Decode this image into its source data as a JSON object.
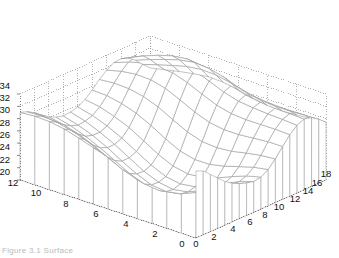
{
  "figure": {
    "kind": "3d-mesh-surface-plot",
    "background_color": "#ffffff",
    "mesh_line_color": "#9a9a9a",
    "mesh_face_color": "#ffffff",
    "grid_line_color": "#8c8c8c",
    "axis_line_color": "#6f6f6f",
    "tick_text_color": "#111111",
    "caption_text": "Figure  3.1  Surface",
    "caption_color": "#c2c2c2"
  },
  "chart_data": {
    "type": "surface",
    "title": "",
    "xlabel": "",
    "ylabel": "",
    "zlabel": "",
    "projection": "3d-mesh-with-skirt",
    "grid": true,
    "legend": null,
    "x_axis": {
      "name": "x-axis-right",
      "ticks": [
        0,
        2,
        4,
        6,
        8,
        10,
        12,
        14,
        16,
        18
      ],
      "tick_labels": [
        "0",
        "2",
        "4",
        "6",
        "8",
        "10",
        "12",
        "14",
        "16",
        "18"
      ],
      "range": [
        0,
        18
      ]
    },
    "y_axis": {
      "name": "y-axis-left",
      "ticks": [
        0,
        2,
        4,
        6,
        8,
        10,
        12
      ],
      "tick_labels": [
        "0",
        "2",
        "4",
        "6",
        "8",
        "10",
        "12"
      ],
      "range": [
        0,
        12
      ]
    },
    "z_axis": {
      "name": "z-axis-vertical",
      "ticks": [
        20,
        22,
        24,
        26,
        28,
        30,
        32,
        34
      ],
      "tick_labels": [
        "20",
        "22",
        "24",
        "26",
        "28",
        "30",
        "32",
        "34"
      ],
      "range": [
        20,
        34
      ]
    },
    "nx": 19,
    "ny": 13,
    "z_values": [
      [
        30.9,
        30.4,
        29.3,
        28.2,
        27.1,
        26.3,
        25.7,
        25.3,
        25.0,
        25.2,
        25.9,
        27.1,
        28.6,
        30.0,
        31.0,
        31.5,
        31.2,
        30.4,
        29.4
      ],
      [
        30.4,
        29.8,
        28.6,
        27.3,
        26.1,
        25.2,
        24.6,
        24.3,
        24.2,
        24.6,
        25.5,
        26.9,
        28.6,
        30.1,
        31.2,
        31.6,
        31.2,
        30.3,
        29.2
      ],
      [
        29.6,
        28.9,
        27.6,
        26.2,
        24.9,
        23.9,
        23.3,
        23.0,
        23.1,
        23.7,
        24.8,
        26.5,
        28.4,
        30.1,
        31.3,
        31.7,
        31.2,
        30.2,
        29.0
      ],
      [
        28.8,
        28.0,
        26.6,
        25.1,
        23.7,
        22.6,
        21.9,
        21.7,
        21.9,
        22.7,
        24.1,
        26.0,
        28.2,
        30.1,
        31.5,
        31.9,
        31.3,
        30.2,
        28.9
      ],
      [
        28.3,
        27.4,
        25.9,
        24.3,
        22.8,
        21.6,
        20.9,
        20.7,
        21.0,
        22.0,
        23.6,
        25.8,
        28.2,
        30.3,
        31.8,
        32.3,
        31.6,
        30.4,
        29.0
      ],
      [
        28.2,
        27.3,
        25.7,
        24.0,
        22.4,
        21.2,
        20.5,
        20.3,
        20.7,
        21.8,
        23.6,
        26.0,
        28.6,
        30.9,
        32.5,
        33.0,
        32.2,
        30.9,
        29.4
      ],
      [
        28.5,
        27.6,
        26.0,
        24.3,
        22.7,
        21.5,
        20.8,
        20.7,
        21.1,
        22.3,
        24.2,
        26.8,
        29.5,
        31.9,
        33.5,
        34.0,
        33.1,
        31.6,
        30.0
      ],
      [
        29.2,
        28.3,
        26.8,
        25.1,
        23.6,
        22.4,
        21.8,
        21.7,
        22.2,
        23.4,
        25.4,
        28.0,
        30.7,
        33.0,
        34.4,
        34.7,
        33.7,
        32.1,
        30.4
      ],
      [
        30.0,
        29.2,
        27.8,
        26.2,
        24.8,
        23.7,
        23.1,
        23.1,
        23.6,
        24.8,
        26.8,
        29.3,
        31.8,
        33.8,
        34.9,
        35.0,
        33.9,
        32.2,
        30.5
      ],
      [
        30.7,
        30.0,
        28.7,
        27.3,
        26.0,
        25.0,
        24.5,
        24.5,
        25.0,
        26.2,
        28.0,
        30.2,
        32.4,
        34.0,
        34.8,
        34.7,
        33.5,
        31.9,
        30.2
      ],
      [
        31.1,
        30.5,
        29.4,
        28.1,
        27.0,
        26.1,
        25.7,
        25.7,
        26.2,
        27.2,
        28.8,
        30.7,
        32.5,
        33.8,
        34.3,
        34.0,
        32.8,
        31.3,
        29.8
      ],
      [
        31.2,
        30.7,
        29.8,
        28.7,
        27.7,
        27.0,
        26.6,
        26.7,
        27.1,
        28.0,
        29.3,
        30.8,
        32.2,
        33.2,
        33.5,
        33.1,
        32.0,
        30.6,
        29.3
      ],
      [
        31.0,
        30.6,
        29.9,
        29.0,
        28.2,
        27.6,
        27.3,
        27.4,
        27.7,
        28.4,
        29.4,
        30.6,
        31.6,
        32.3,
        32.4,
        32.0,
        31.1,
        29.9,
        28.8
      ]
    ]
  },
  "z_tick_positions": [
    {
      "label": "34",
      "x": 10,
      "y": 89
    },
    {
      "label": "32",
      "x": 10,
      "y": 101
    },
    {
      "label": "30",
      "x": 10,
      "y": 113
    },
    {
      "label": "28",
      "x": 10,
      "y": 126
    },
    {
      "label": "26",
      "x": 10,
      "y": 138
    },
    {
      "label": "24",
      "x": 10,
      "y": 150
    },
    {
      "label": "22",
      "x": 10,
      "y": 163
    },
    {
      "label": "20",
      "x": 10,
      "y": 175
    }
  ],
  "y_tick_positions": [
    {
      "label": "12",
      "x": 13,
      "y": 186
    },
    {
      "label": "10",
      "x": 36,
      "y": 196
    },
    {
      "label": "8",
      "x": 66,
      "y": 207
    },
    {
      "label": "6",
      "x": 96,
      "y": 217
    },
    {
      "label": "4",
      "x": 126,
      "y": 227
    },
    {
      "label": "2",
      "x": 155,
      "y": 237
    },
    {
      "label": "0",
      "x": 182,
      "y": 247
    }
  ],
  "x_tick_positions": [
    {
      "label": "0",
      "x": 196,
      "y": 247
    },
    {
      "label": "2",
      "x": 214,
      "y": 240
    },
    {
      "label": "4",
      "x": 233,
      "y": 232
    },
    {
      "label": "6",
      "x": 250,
      "y": 225
    },
    {
      "label": "8",
      "x": 265,
      "y": 218
    },
    {
      "label": "10",
      "x": 279,
      "y": 210
    },
    {
      "label": "12",
      "x": 295,
      "y": 202
    },
    {
      "label": "14",
      "x": 308,
      "y": 194
    },
    {
      "label": "16",
      "x": 317,
      "y": 186
    },
    {
      "label": "18",
      "x": 326,
      "y": 177
    }
  ]
}
